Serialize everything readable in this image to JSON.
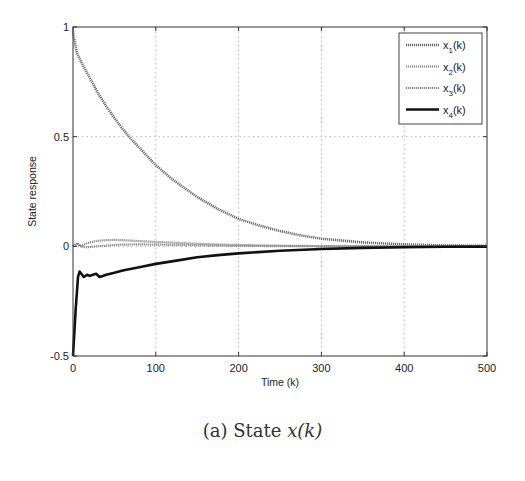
{
  "caption": {
    "prefix": "(a) State ",
    "math": "x(k)"
  },
  "chart_data": {
    "type": "line",
    "title": "",
    "xlabel": "Time (k)",
    "ylabel": "State response",
    "xlim": [
      0,
      500
    ],
    "ylim": [
      -0.5,
      1
    ],
    "xticks": [
      0,
      100,
      200,
      300,
      400,
      500
    ],
    "yticks": [
      -0.5,
      0,
      0.5,
      1
    ],
    "xtick_labels": [
      "0",
      "100",
      "200",
      "300",
      "400",
      "500"
    ],
    "ytick_labels": [
      "-0.5",
      "0",
      "0.5",
      "1"
    ],
    "grid": true,
    "legend_position": "upper right",
    "series": [
      {
        "name": "x1(k)",
        "label_base": "x",
        "label_sub": "1",
        "label_tail": "(k)",
        "style": "textured",
        "color": "#6e6e6e",
        "width": 2.6,
        "x": [
          0,
          2,
          5,
          10,
          20,
          30,
          40,
          50,
          60,
          70,
          80,
          100,
          120,
          150,
          175,
          200,
          225,
          250,
          275,
          300,
          350,
          400,
          450,
          500
        ],
        "y": [
          0.98,
          0.93,
          0.88,
          0.84,
          0.77,
          0.7,
          0.64,
          0.585,
          0.535,
          0.49,
          0.45,
          0.37,
          0.305,
          0.225,
          0.17,
          0.125,
          0.095,
          0.07,
          0.05,
          0.035,
          0.018,
          0.009,
          0.004,
          0.002
        ]
      },
      {
        "name": "x2(k)",
        "label_base": "x",
        "label_sub": "2",
        "label_tail": "(k)",
        "style": "textured",
        "color": "#8a8a8a",
        "width": 2.2,
        "x": [
          0,
          5,
          10,
          15,
          20,
          30,
          40,
          50,
          60,
          70,
          80,
          100,
          130,
          160,
          200,
          250,
          300,
          400,
          500
        ],
        "y": [
          0.0,
          0.015,
          0.0,
          0.012,
          0.018,
          0.025,
          0.028,
          0.03,
          0.028,
          0.026,
          0.024,
          0.02,
          0.015,
          0.01,
          0.006,
          0.003,
          0.001,
          0.0,
          0.0
        ]
      },
      {
        "name": "x3(k)",
        "label_base": "x",
        "label_sub": "3",
        "label_tail": "(k)",
        "style": "textured",
        "color": "#8a8a8a",
        "width": 2.2,
        "x": [
          0,
          5,
          10,
          15,
          20,
          30,
          40,
          50,
          60,
          80,
          100,
          130,
          160,
          200,
          250,
          300,
          400,
          500
        ],
        "y": [
          0.0,
          0.01,
          0.0,
          -0.005,
          -0.003,
          0.0,
          0.003,
          0.006,
          0.008,
          0.009,
          0.008,
          0.006,
          0.004,
          0.002,
          0.001,
          0.0,
          0.0,
          0.0
        ]
      },
      {
        "name": "x4(k)",
        "label_base": "x",
        "label_sub": "4",
        "label_tail": "(k)",
        "style": "solid",
        "color": "#111111",
        "width": 2.6,
        "x": [
          0,
          3,
          6,
          8,
          10,
          13,
          17,
          20,
          24,
          28,
          32,
          36,
          40,
          50,
          60,
          80,
          100,
          125,
          150,
          175,
          200,
          250,
          300,
          350,
          400,
          450,
          500
        ],
        "y": [
          -0.5,
          -0.3,
          -0.14,
          -0.115,
          -0.125,
          -0.14,
          -0.13,
          -0.135,
          -0.13,
          -0.125,
          -0.14,
          -0.135,
          -0.13,
          -0.12,
          -0.11,
          -0.095,
          -0.08,
          -0.065,
          -0.05,
          -0.04,
          -0.032,
          -0.02,
          -0.012,
          -0.007,
          -0.004,
          -0.002,
          -0.001
        ]
      }
    ]
  }
}
